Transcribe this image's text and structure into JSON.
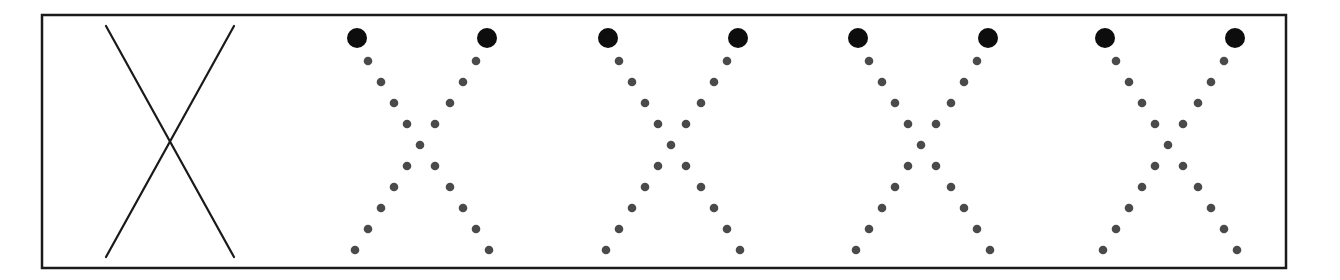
{
  "diagram": {
    "frame": {
      "x": 42,
      "y": 15,
      "width": 1244,
      "height": 253,
      "stroke": "#1a1a1a",
      "stroke_width": 2.5
    },
    "solid_x": {
      "stroke": "#1a1a1a",
      "stroke_width": 2.2,
      "lines": [
        {
          "x1": 106,
          "y1": 26,
          "x2": 234,
          "y2": 257
        },
        {
          "x1": 234,
          "y1": 26,
          "x2": 106,
          "y2": 257
        }
      ]
    },
    "dotted_x_patterns": {
      "count": 4,
      "origins_x": [
        357,
        608,
        858,
        1105
      ],
      "width": 130,
      "large_dot": {
        "y": 38,
        "radius": 10,
        "color": "#0d0d0d"
      },
      "small_dot": {
        "radius": 4.3,
        "color": "#4a4a4a"
      },
      "rows_y": [
        61,
        82,
        103,
        124,
        145,
        166,
        187,
        208,
        229,
        250
      ],
      "left_diagonal_x_offsets": [
        11,
        24,
        37,
        50,
        63,
        50,
        37,
        24,
        11,
        -2
      ],
      "right_diagonal_x_offsets": [
        119,
        106,
        93,
        78,
        63,
        78,
        93,
        106,
        119,
        132
      ]
    }
  }
}
